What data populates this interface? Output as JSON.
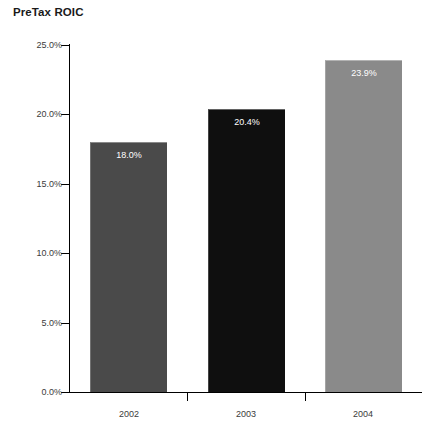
{
  "chart_data": {
    "type": "bar",
    "title": "PreTax ROIC",
    "xlabel": "",
    "ylabel": "",
    "categories": [
      "2002",
      "2003",
      "2004"
    ],
    "values": [
      18.0,
      20.4,
      23.9
    ],
    "value_labels": [
      "18.0%",
      "20.4%",
      "23.9%"
    ],
    "bar_colors": [
      "#4a4a4a",
      "#0f0f0f",
      "#8a8a8a"
    ],
    "ylim": [
      0,
      25
    ],
    "ytick_values": [
      0,
      5,
      10,
      15,
      20,
      25
    ],
    "ytick_labels": [
      "0.0%",
      "5.0%",
      "10.0%",
      "15.0%",
      "20.0%",
      "25.0%"
    ],
    "grid": false,
    "legend": "none",
    "axis_color": "#000000",
    "tick_label_color": "#3b3b3b",
    "data_label_color": "#ffffff",
    "background": "#ffffff"
  },
  "axis": {
    "y_ticks": [
      {
        "label": "25.0%",
        "value": 25
      },
      {
        "label": "20.0%",
        "value": 20
      },
      {
        "label": "15.0%",
        "value": 15
      },
      {
        "label": "10.0%",
        "value": 10
      },
      {
        "label": "5.0%",
        "value": 5
      },
      {
        "label": "0.0%",
        "value": 0
      }
    ],
    "x_categories": [
      {
        "label": "2002"
      },
      {
        "label": "2003"
      },
      {
        "label": "2004"
      }
    ]
  },
  "bars": [
    {
      "category": "2002",
      "label": "18.0%",
      "value": 18.0,
      "color": "#4a4a4a"
    },
    {
      "category": "2003",
      "label": "20.4%",
      "value": 20.4,
      "color": "#0f0f0f"
    },
    {
      "category": "2004",
      "label": "23.9%",
      "value": 23.9,
      "color": "#8a8a8a"
    }
  ]
}
